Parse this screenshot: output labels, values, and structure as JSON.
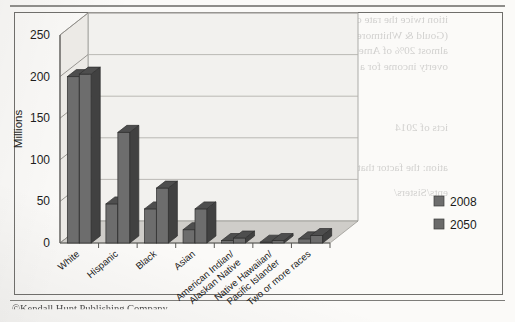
{
  "page": {
    "footer_credit": "©Kendall Hunt Publishing Company",
    "bleed_through_lines": [
      "ition twice the rate of what scientifically developed countries",
      "(Gould & Whitmore 2013). In 2012, more than 16% of the U.S.",
      "almost 20% of American children, lived below the federal",
      "overty income for a family of four) (U.S. Census Bureau 2013).",
      "icts of 2014",
      "ation: the factor that's most expressive",
      "ents/Sisters/"
    ]
  },
  "chart_data": {
    "type": "bar",
    "title": "",
    "xlabel": "",
    "ylabel": "Millions",
    "ylim": [
      0,
      250
    ],
    "yticks": [
      0,
      50,
      100,
      150,
      200,
      250
    ],
    "grid": true,
    "legend_position": "right",
    "three_d": true,
    "categories": [
      "White",
      "Hispanic",
      "Black",
      "Asian",
      "American Indian/\nAlaskan Native",
      "Native Hawaiian/\nPacific Islander",
      "Two or more races"
    ],
    "category_lines": [
      [
        "White"
      ],
      [
        "Hispanic"
      ],
      [
        "Black"
      ],
      [
        "Asian"
      ],
      [
        "American Indian/",
        "Alaskan Native"
      ],
      [
        "Native Hawaiian/",
        "Pacific Islander"
      ],
      [
        "Two or more races"
      ]
    ],
    "series": [
      {
        "name": "2008",
        "color": "#6d6d6d",
        "values": [
          200,
          47,
          41,
          16,
          3,
          1,
          5
        ]
      },
      {
        "name": "2050",
        "color": "#6a6a6a",
        "values": [
          203,
          133,
          66,
          41,
          6,
          3,
          9
        ]
      }
    ]
  },
  "legend": {
    "items": [
      {
        "label": "2008",
        "swatch": "#6d6d6d"
      },
      {
        "label": "2050",
        "swatch": "#6a6a6a"
      }
    ]
  },
  "colors": {
    "bar_front": "#6d6d6d",
    "bar_top": "#4e4e4e",
    "bar_side": "#414141",
    "floor": "#cfcdc9",
    "back_wall": "#f2f1ee",
    "frame_line": "#6f6e6b",
    "grid_line": "#b4b2ae"
  }
}
